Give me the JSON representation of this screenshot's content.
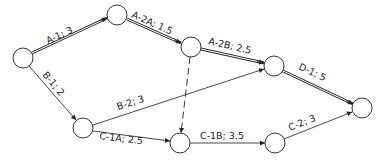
{
  "diagram": {
    "type": "activity-on-arrow network",
    "nodes": [
      {
        "id": "n1",
        "x": 23,
        "y": 58,
        "r": 10
      },
      {
        "id": "n2",
        "x": 117,
        "y": 15,
        "r": 10
      },
      {
        "id": "n3",
        "x": 191,
        "y": 47,
        "r": 10
      },
      {
        "id": "n4",
        "x": 274,
        "y": 66,
        "r": 10
      },
      {
        "id": "n5",
        "x": 362,
        "y": 108,
        "r": 10
      },
      {
        "id": "n6",
        "x": 83,
        "y": 128,
        "r": 10
      },
      {
        "id": "n7",
        "x": 180,
        "y": 143,
        "r": 10
      },
      {
        "id": "n8",
        "x": 275,
        "y": 143,
        "r": 10
      }
    ],
    "edges": [
      {
        "from": "n1",
        "to": "n2",
        "activity": "A-1",
        "duration": "3",
        "label": "A-1;  3",
        "style": "critical"
      },
      {
        "from": "n2",
        "to": "n3",
        "activity": "A-2A",
        "duration": "1.5",
        "label": "A-2A;  1.5",
        "style": "critical"
      },
      {
        "from": "n3",
        "to": "n4",
        "activity": "A-2B",
        "duration": "2.5",
        "label": "A-2B;  2.5",
        "style": "critical"
      },
      {
        "from": "n4",
        "to": "n5",
        "activity": "D-1",
        "duration": "5",
        "label": "D-1;  5",
        "style": "critical"
      },
      {
        "from": "n1",
        "to": "n6",
        "activity": "B-1",
        "duration": "2",
        "label": "B-1;  2",
        "style": "normal"
      },
      {
        "from": "n6",
        "to": "n4",
        "activity": "B-2",
        "duration": "3",
        "label": "B-2;  3",
        "style": "normal"
      },
      {
        "from": "n6",
        "to": "n7",
        "activity": "C-1A",
        "duration": "2.5",
        "label": "C-1A;  2.5",
        "style": "normal"
      },
      {
        "from": "n3",
        "to": "n7",
        "activity": "dummy",
        "duration": "",
        "label": "",
        "style": "dummy"
      },
      {
        "from": "n7",
        "to": "n8",
        "activity": "C-1B",
        "duration": "3.5",
        "label": "C-1B;  3.5",
        "style": "normal"
      },
      {
        "from": "n8",
        "to": "n5",
        "activity": "C-2",
        "duration": "3",
        "label": "C-2;  3",
        "style": "normal"
      }
    ]
  },
  "labels": {
    "a1": "A-1;  3",
    "a2a": "A-2A;  1.5",
    "a2b": "A-2B;  2.5",
    "d1": "D-1;  5",
    "b1": "B-1;  2",
    "b2": "B-2;  3",
    "c1a": "C-1A;  2.5",
    "c1b": "C-1B;  3.5",
    "c2": "C-2;  3"
  },
  "colors": {
    "line": "#333333",
    "background": "#ffffff",
    "text": "#222222"
  }
}
